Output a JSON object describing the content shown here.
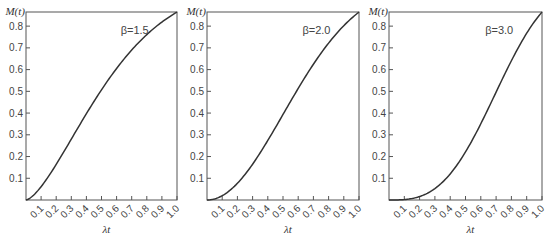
{
  "chart_data": [
    {
      "type": "line",
      "title": "",
      "annotation": "β=1.5",
      "beta": 1.5,
      "xlabel": "λt",
      "ylabel": "M(t)",
      "xlim": [
        0,
        1.0
      ],
      "ylim": [
        0,
        0.865
      ],
      "grid": false,
      "x_ticks": [
        "0.1",
        "0.2",
        "0.3",
        "0.4",
        "0.5",
        "0.6",
        "0.7",
        "0.8",
        "0.9",
        "1.0"
      ],
      "y_ticks": [
        "0.1",
        "0.2",
        "0.3",
        "0.4",
        "0.5",
        "0.6",
        "0.7",
        "0.8"
      ],
      "x": [
        0,
        0.1,
        0.2,
        0.3,
        0.4,
        0.5,
        0.6,
        0.7,
        0.8,
        0.9,
        1.0
      ],
      "series": [
        {
          "name": "β=1.5",
          "values": [
            0,
            0.061,
            0.164,
            0.28,
            0.397,
            0.507,
            0.605,
            0.69,
            0.763,
            0.819,
            0.865
          ]
        }
      ]
    },
    {
      "type": "line",
      "title": "",
      "annotation": "β=2.0",
      "beta": 2.0,
      "xlabel": "λt",
      "ylabel": "M(t)",
      "xlim": [
        0,
        1.0
      ],
      "ylim": [
        0,
        0.865
      ],
      "grid": false,
      "x_ticks": [
        "0.1",
        "0.2",
        "0.3",
        "0.4",
        "0.5",
        "0.6",
        "0.7",
        "0.8",
        "0.9",
        "1.0"
      ],
      "y_ticks": [
        "0.1",
        "0.2",
        "0.3",
        "0.4",
        "0.5",
        "0.6",
        "0.7",
        "0.8"
      ],
      "x": [
        0,
        0.1,
        0.2,
        0.3,
        0.4,
        0.5,
        0.6,
        0.7,
        0.8,
        0.9,
        1.0
      ],
      "series": [
        {
          "name": "β=2.0",
          "values": [
            0,
            0.02,
            0.077,
            0.165,
            0.274,
            0.393,
            0.513,
            0.625,
            0.722,
            0.802,
            0.865
          ]
        }
      ]
    },
    {
      "type": "line",
      "title": "",
      "annotation": "β=3.0",
      "beta": 3.0,
      "xlabel": "λt",
      "ylabel": "M(t)",
      "xlim": [
        0,
        1.0
      ],
      "ylim": [
        0,
        0.865
      ],
      "grid": false,
      "x_ticks": [
        "0.1",
        "0.2",
        "0.3",
        "0.4",
        "0.5",
        "0.6",
        "0.7",
        "0.8",
        "0.9",
        "1.0"
      ],
      "y_ticks": [
        "0.1",
        "0.2",
        "0.3",
        "0.4",
        "0.5",
        "0.6",
        "0.7",
        "0.8"
      ],
      "x": [
        0,
        0.1,
        0.2,
        0.3,
        0.4,
        0.5,
        0.6,
        0.7,
        0.8,
        0.9,
        1.0
      ],
      "series": [
        {
          "name": "β=3.0",
          "values": [
            0,
            0.002,
            0.016,
            0.053,
            0.12,
            0.221,
            0.351,
            0.496,
            0.64,
            0.767,
            0.865
          ]
        }
      ]
    }
  ]
}
